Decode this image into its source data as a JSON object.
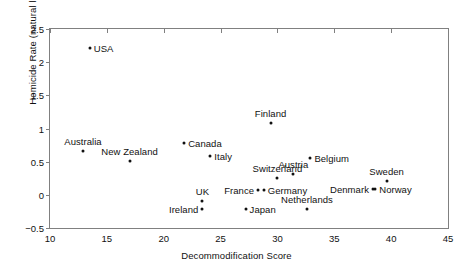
{
  "chart_data": {
    "type": "scatter",
    "title": "",
    "xlabel": "Decommodification Score",
    "ylabel": "Homicide Rate (natural log)",
    "xlim": [
      10,
      45
    ],
    "ylim": [
      -0.5,
      2.5
    ],
    "xticks": [
      10,
      15,
      20,
      25,
      30,
      35,
      40,
      45
    ],
    "yticks": [
      -0.5,
      0,
      0.5,
      1,
      1.5,
      2,
      2.5
    ],
    "xtick_labels": [
      "10",
      "15",
      "20",
      "25",
      "30",
      "35",
      "40",
      "45"
    ],
    "ytick_labels": [
      "−0.5",
      "0",
      "0.5",
      "1",
      "1.5",
      "2",
      "2.5"
    ],
    "grid": false,
    "legend": "none",
    "marker": "filled-circle",
    "marker_color": "#111111",
    "points": [
      {
        "label": "USA",
        "x": 13.5,
        "y": 2.21,
        "label_pos": "right"
      },
      {
        "label": "Australia",
        "x": 12.9,
        "y": 0.66,
        "label_pos": "top"
      },
      {
        "label": "New Zealand",
        "x": 17.0,
        "y": 0.51,
        "label_pos": "top"
      },
      {
        "label": "Canada",
        "x": 21.8,
        "y": 0.78,
        "label_pos": "right"
      },
      {
        "label": "Italy",
        "x": 24.1,
        "y": 0.58,
        "label_pos": "right"
      },
      {
        "label": "Finland",
        "x": 29.4,
        "y": 1.09,
        "label_pos": "top"
      },
      {
        "label": "Belgium",
        "x": 32.9,
        "y": 0.55,
        "label_pos": "right"
      },
      {
        "label": "Switzerland",
        "x": 30.0,
        "y": 0.25,
        "label_pos": "top"
      },
      {
        "label": "Austria",
        "x": 31.4,
        "y": 0.31,
        "label_pos": "top"
      },
      {
        "label": "Sweden",
        "x": 39.6,
        "y": 0.21,
        "label_pos": "top"
      },
      {
        "label": "France",
        "x": 28.3,
        "y": 0.08,
        "label_pos": "left"
      },
      {
        "label": "Germany",
        "x": 28.8,
        "y": 0.08,
        "label_pos": "right"
      },
      {
        "label": "Denmark",
        "x": 38.4,
        "y": 0.09,
        "label_pos": "left"
      },
      {
        "label": "Norway",
        "x": 38.6,
        "y": 0.09,
        "label_pos": "right"
      },
      {
        "label": "UK",
        "x": 23.4,
        "y": -0.1,
        "label_pos": "top"
      },
      {
        "label": "Ireland",
        "x": 23.4,
        "y": -0.22,
        "label_pos": "left"
      },
      {
        "label": "Japan",
        "x": 27.2,
        "y": -0.22,
        "label_pos": "right"
      },
      {
        "label": "Netherlands",
        "x": 32.6,
        "y": -0.22,
        "label_pos": "top"
      }
    ]
  }
}
